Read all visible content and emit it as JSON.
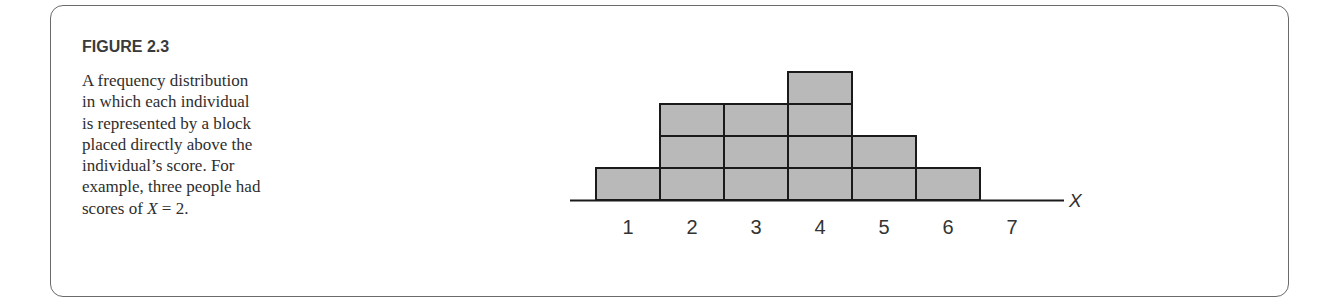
{
  "figure": {
    "title": "FIGURE 2.3",
    "caption_lines": [
      "A frequency distribution",
      "in which each individual",
      "is represented by a block",
      "placed directly above the",
      "individual’s score. For",
      "example, three people had",
      "scores of "
    ],
    "caption_tail_var": "X",
    "caption_tail_rest": " = 2."
  },
  "colors": {
    "block_fill": "#b9b9b9",
    "block_stroke": "#1a1a1a",
    "border": "#6a6a6a"
  },
  "chart_data": {
    "type": "bar",
    "subtype": "block frequency distribution",
    "title": "FIGURE 2.3",
    "xlabel": "X",
    "ylabel": "",
    "categories": [
      "1",
      "2",
      "3",
      "4",
      "5",
      "6",
      "7"
    ],
    "values": [
      1,
      3,
      3,
      4,
      2,
      1,
      0
    ],
    "ylim": [
      0,
      4
    ],
    "grid": false,
    "legend": null,
    "annotation": "Each individual is represented by a block placed directly above the individual's score."
  }
}
